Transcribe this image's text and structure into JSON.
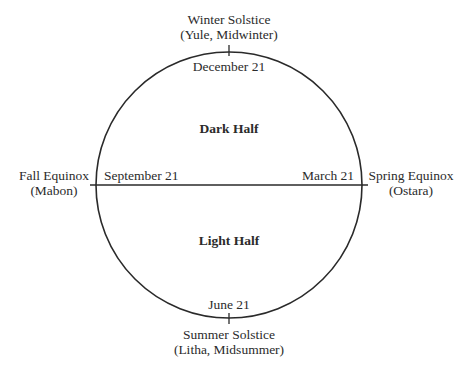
{
  "diagram": {
    "circle": {
      "cx": 229,
      "cy": 185,
      "r": 133,
      "stroke": "#2a2a2a"
    },
    "halves": {
      "top": "Dark Half",
      "bottom": "Light Half"
    },
    "points": {
      "top": {
        "festival_line1": "Winter Solstice",
        "festival_line2": "(Yule, Midwinter)",
        "date": "December 21"
      },
      "left": {
        "festival_line1": "Fall Equinox",
        "festival_line2": "(Mabon)",
        "date": "September 21"
      },
      "right": {
        "festival_line1": "Spring Equinox",
        "festival_line2": "(Ostara)",
        "date": "March 21"
      },
      "bottom": {
        "festival_line1": "Summer Solstice",
        "festival_line2": "(Litha, Midsummer)",
        "date": "June 21"
      }
    }
  }
}
